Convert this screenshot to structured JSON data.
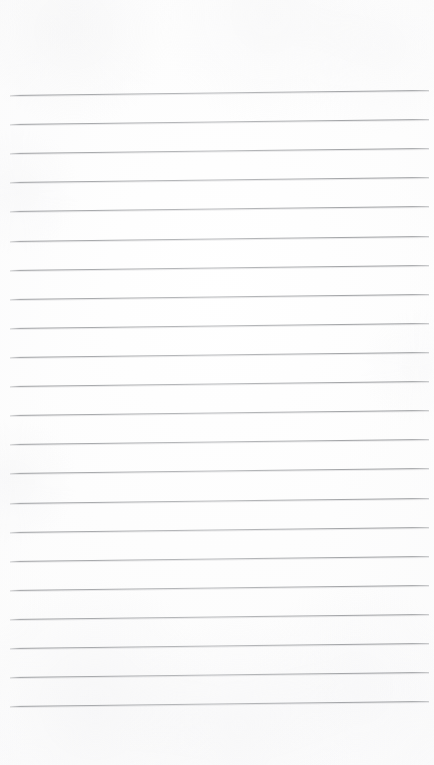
{
  "document": {
    "kind": "scanned-blank-ruled-paper",
    "page_label": "",
    "orientation": "portrait",
    "canvas_width_px": 434,
    "canvas_height_px": 765,
    "background_color": "#fdfdfd",
    "has_visible_text": false,
    "has_vertical_margin_rule": false,
    "has_header_text": false,
    "has_footer_text": false
  },
  "ruling": {
    "line_count": 22,
    "line_color": "#a8aaac",
    "line_thickness_px": 1,
    "line_spacing_px": 29.1,
    "first_line_y_px": 95,
    "last_line_y_px": 707,
    "line_start_x_px": 10,
    "line_end_x_px": 429,
    "line_length_px": 419,
    "skew_rise_px": -5,
    "skew_degrees": -0.68
  },
  "margins": {
    "top_margin_px": 93,
    "bottom_margin_px": 57,
    "left_margin_px": 10,
    "right_margin_px": 5
  },
  "lines": [
    {
      "index": 1,
      "left_y_px": 95.0,
      "right_y_px": 90.0,
      "content": ""
    },
    {
      "index": 2,
      "left_y_px": 124.1,
      "right_y_px": 119.1,
      "content": ""
    },
    {
      "index": 3,
      "left_y_px": 153.2,
      "right_y_px": 148.2,
      "content": ""
    },
    {
      "index": 4,
      "left_y_px": 182.3,
      "right_y_px": 177.3,
      "content": ""
    },
    {
      "index": 5,
      "left_y_px": 211.4,
      "right_y_px": 206.4,
      "content": ""
    },
    {
      "index": 6,
      "left_y_px": 240.5,
      "right_y_px": 235.5,
      "content": ""
    },
    {
      "index": 7,
      "left_y_px": 269.7,
      "right_y_px": 264.7,
      "content": ""
    },
    {
      "index": 8,
      "left_y_px": 298.8,
      "right_y_px": 293.8,
      "content": ""
    },
    {
      "index": 9,
      "left_y_px": 327.9,
      "right_y_px": 322.9,
      "content": ""
    },
    {
      "index": 10,
      "left_y_px": 357.0,
      "right_y_px": 352.0,
      "content": ""
    },
    {
      "index": 11,
      "left_y_px": 386.1,
      "right_y_px": 381.1,
      "content": ""
    },
    {
      "index": 12,
      "left_y_px": 415.2,
      "right_y_px": 410.2,
      "content": ""
    },
    {
      "index": 13,
      "left_y_px": 444.3,
      "right_y_px": 439.3,
      "content": ""
    },
    {
      "index": 14,
      "left_y_px": 473.4,
      "right_y_px": 468.4,
      "content": ""
    },
    {
      "index": 15,
      "left_y_px": 502.6,
      "right_y_px": 497.6,
      "content": ""
    },
    {
      "index": 16,
      "left_y_px": 531.7,
      "right_y_px": 526.7,
      "content": ""
    },
    {
      "index": 17,
      "left_y_px": 560.8,
      "right_y_px": 555.8,
      "content": ""
    },
    {
      "index": 18,
      "left_y_px": 589.9,
      "right_y_px": 584.9,
      "content": ""
    },
    {
      "index": 19,
      "left_y_px": 619.0,
      "right_y_px": 614.0,
      "content": ""
    },
    {
      "index": 20,
      "left_y_px": 648.1,
      "right_y_px": 643.1,
      "content": ""
    },
    {
      "index": 21,
      "left_y_px": 677.2,
      "right_y_px": 672.2,
      "content": ""
    },
    {
      "index": 22,
      "left_y_px": 706.3,
      "right_y_px": 701.3,
      "content": ""
    }
  ]
}
